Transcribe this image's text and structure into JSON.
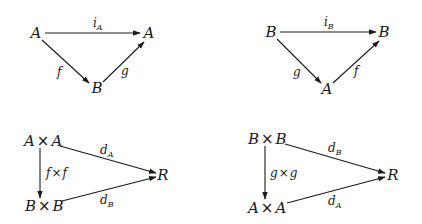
{
  "diagrams": [
    {
      "name": "triangle-iA",
      "nodes": {
        "left": "A",
        "right": "A",
        "bottom": "B"
      },
      "edges": {
        "top": {
          "label": "i",
          "sub": "A"
        },
        "left": {
          "label": "f"
        },
        "right": {
          "label": "g"
        }
      }
    },
    {
      "name": "triangle-iB",
      "nodes": {
        "left": "B",
        "right": "B",
        "bottom": "A"
      },
      "edges": {
        "top": {
          "label": "i",
          "sub": "B"
        },
        "left": {
          "label": "g"
        },
        "right": {
          "label": "f"
        }
      }
    },
    {
      "name": "metric-A",
      "nodes": {
        "top_a": "A",
        "top_b": "A",
        "bottom_a": "B",
        "bottom_b": "B",
        "target": "R",
        "times": "×"
      },
      "edges": {
        "vertical": {
          "a": "f",
          "b": "f"
        },
        "upper": {
          "label": "d",
          "sub": "A"
        },
        "lower": {
          "label": "d",
          "sub": "B"
        }
      }
    },
    {
      "name": "metric-B",
      "nodes": {
        "top_a": "B",
        "top_b": "B",
        "bottom_a": "A",
        "bottom_b": "A",
        "target": "R",
        "times": "×"
      },
      "edges": {
        "vertical": {
          "a": "g",
          "b": "g"
        },
        "upper": {
          "label": "d",
          "sub": "B"
        },
        "lower": {
          "label": "d",
          "sub": "A"
        }
      }
    }
  ]
}
